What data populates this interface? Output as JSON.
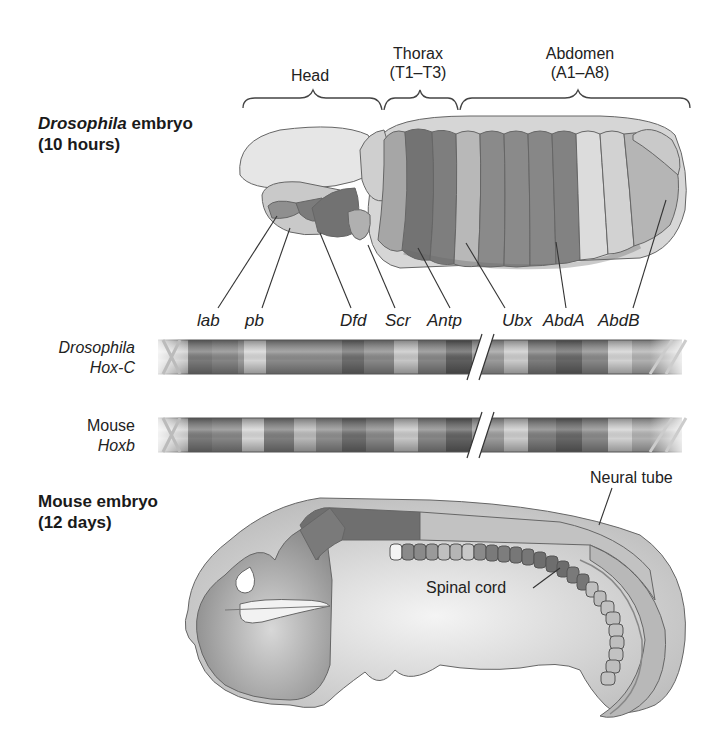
{
  "drosophila": {
    "title_italic": "Drosophila",
    "title_rest": " embryo",
    "age": "(10 hours)",
    "regions": [
      {
        "label": "Head",
        "sub": ""
      },
      {
        "label": "Thorax",
        "sub": "(T1–T3)"
      },
      {
        "label": "Abdomen",
        "sub": "(A1–A8)"
      }
    ]
  },
  "genes": [
    "lab",
    "pb",
    "Dfd",
    "Scr",
    "Antp",
    "Ubx",
    "AbdA",
    "AbdB"
  ],
  "clusters": [
    {
      "species": "Drosophila",
      "name": "Hox-C",
      "species_italic": true
    },
    {
      "species": "Mouse",
      "name": "Hoxb",
      "species_italic": false
    }
  ],
  "mouse": {
    "title": "Mouse embryo",
    "age": "(12 days)",
    "labels": {
      "neural_tube": "Neural tube",
      "spinal_cord": "Spinal cord"
    }
  },
  "colors": {
    "bg": "#ffffff",
    "light": "#d9d9d9",
    "mid": "#9a9a9a",
    "dark": "#6e6e6e",
    "darkest": "#5a5a5a",
    "outline": "#555555"
  }
}
